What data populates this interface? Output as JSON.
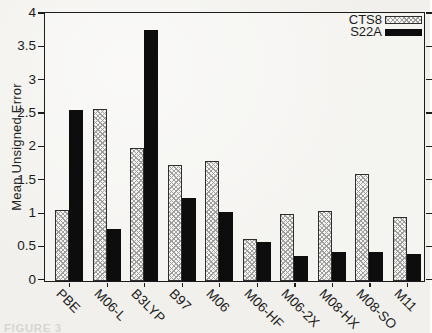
{
  "colors": {
    "frame": "#1c1c1c",
    "solid_bar": "#0d0d0d",
    "hatch_line": "#9e9e9e",
    "hatch_fill": "#f6f4f0",
    "page_background": "#f1f0ec"
  },
  "legend": {
    "items": [
      {
        "label": "CTS8",
        "pattern": "crosshatch"
      },
      {
        "label": "S22A",
        "pattern": "solid"
      }
    ]
  },
  "caption_fragment": "FIGURE 3",
  "chart_data": {
    "type": "bar",
    "title": "",
    "xlabel": "",
    "ylabel": "Mean Unsigned Error",
    "ylim": [
      0,
      4
    ],
    "ytick_step": 0.5,
    "grid": false,
    "legend_position": "top-right",
    "bar_outline": true,
    "xlabel_rotation_deg": 45,
    "categories": [
      "PBE",
      "M06-L",
      "B3LYP",
      "B97",
      "M06",
      "M06-HF",
      "M06-2X",
      "M08-HX",
      "M08-SO",
      "M11"
    ],
    "series": [
      {
        "name": "CTS8",
        "pattern": "crosshatch",
        "values": [
          1.07,
          2.58,
          2.0,
          1.74,
          1.8,
          0.63,
          1.01,
          1.05,
          1.6,
          0.96
        ]
      },
      {
        "name": "S22A",
        "pattern": "solid",
        "values": [
          2.56,
          0.78,
          3.76,
          1.25,
          1.03,
          0.59,
          0.37,
          0.43,
          0.44,
          0.4
        ]
      }
    ]
  }
}
